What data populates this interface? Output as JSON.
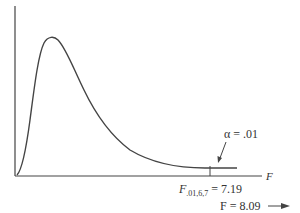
{
  "diagram": {
    "type": "F-distribution density curve",
    "axis_label_x": "F",
    "alpha_label": "α = .01",
    "critical_label_base": "F",
    "critical_label_sub": ".01,6,7",
    "critical_label_value": " = 7.19",
    "observed_label": "F = 8.09",
    "critical_value": 7.19,
    "observed_value": 8.09,
    "alpha": 0.01,
    "df1": 6,
    "df2": 7
  },
  "colors": {
    "stroke": "#444444",
    "text": "#333333",
    "background": "#ffffff"
  }
}
